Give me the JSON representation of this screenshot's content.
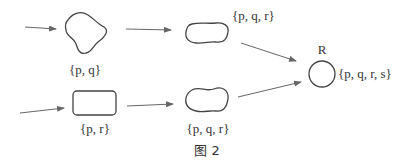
{
  "diagram": {
    "caption": "图 2",
    "nodes": [
      {
        "id": "n1",
        "shape": "irregular-blob",
        "label": "{p, q}"
      },
      {
        "id": "n2",
        "shape": "rounded-rectangle",
        "label": "{p, r}"
      },
      {
        "id": "n3",
        "shape": "blob",
        "label": "{p, q, r}"
      },
      {
        "id": "n4",
        "shape": "blob",
        "label": "{p, q, r}"
      },
      {
        "id": "R",
        "shape": "circle",
        "name": "R",
        "label": "{p, q, r, s}"
      }
    ],
    "edges": [
      {
        "from": "input",
        "to": "n1"
      },
      {
        "from": "n1",
        "to": "n3"
      },
      {
        "from": "n3",
        "to": "R"
      },
      {
        "from": "input",
        "to": "n2"
      },
      {
        "from": "n2",
        "to": "n4"
      },
      {
        "from": "n4",
        "to": "R"
      }
    ],
    "colors": {
      "stroke": "#444444",
      "arrow": "#666666",
      "text": "#333333"
    }
  }
}
